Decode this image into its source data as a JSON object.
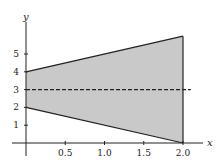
{
  "chart_data": {
    "type": "area",
    "title": "",
    "xlabel": "x",
    "ylabel": "y",
    "xlim": [
      0,
      2.1
    ],
    "ylim": [
      0,
      6.5
    ],
    "x_ticks": [
      0.5,
      1.0,
      1.5,
      2.0
    ],
    "x_tick_labels": [
      "0.5",
      "1.0",
      "1.5",
      "2.0"
    ],
    "y_ticks": [
      1,
      2,
      3,
      4,
      5
    ],
    "y_tick_labels": [
      "1",
      "2",
      "3",
      "4",
      "5"
    ],
    "grid": false,
    "legend": null,
    "series": [
      {
        "name": "upper boundary",
        "style": "solid",
        "x": [
          0,
          2
        ],
        "y": [
          4,
          6
        ]
      },
      {
        "name": "lower boundary",
        "style": "solid",
        "x": [
          0,
          2
        ],
        "y": [
          2,
          0
        ]
      },
      {
        "name": "right boundary",
        "style": "solid",
        "x": [
          2,
          2
        ],
        "y": [
          0,
          6
        ]
      },
      {
        "name": "y = 3",
        "style": "dashed",
        "x": [
          0,
          2.1
        ],
        "y": [
          3,
          3
        ]
      }
    ],
    "shaded_region": {
      "vertices": [
        [
          0,
          2
        ],
        [
          0,
          4
        ],
        [
          2,
          6
        ],
        [
          2,
          0
        ]
      ],
      "fill": "#c9c9c9"
    }
  },
  "colors": {
    "fill": "#c9c9c9",
    "line": "#222222"
  }
}
